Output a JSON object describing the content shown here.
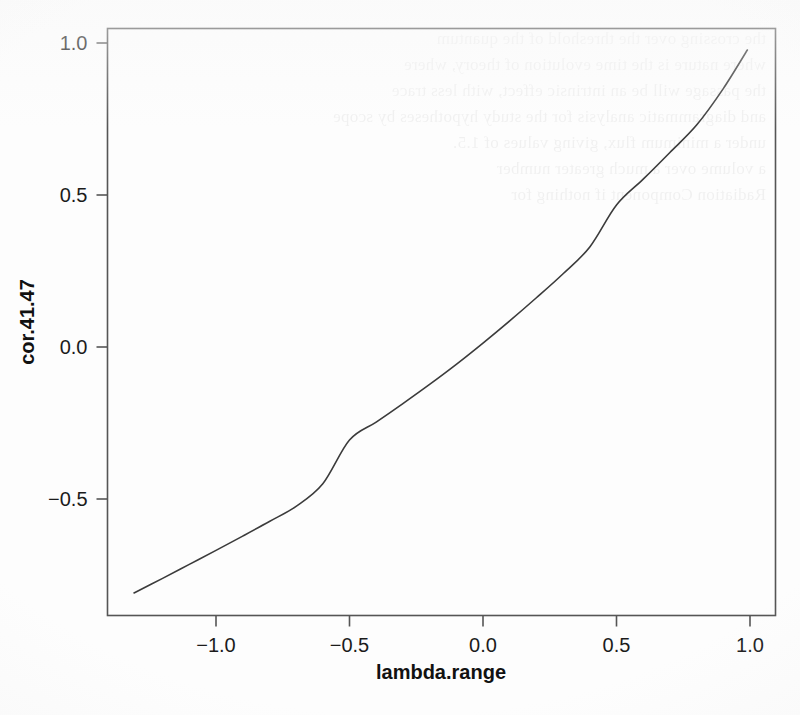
{
  "figure": {
    "background_color": "#fdfdfd",
    "ink_color": "#3b3b3b",
    "box_color": "#555555",
    "scan_bleed_lines": [
      "the crossing over the threshold of the quantum",
      "where nature is the time evolution of theory, where",
      "the passage will be an intrinsic effect, with less trace",
      "and diagrammatic analysis for the study hypotheses by scope",
      "under a minimum flux, giving values of 1.5.",
      "a volume over a much greater number",
      "Radiation Component if nothing for"
    ]
  },
  "chart_data": {
    "type": "line",
    "title": "",
    "xlabel": "lambda.range",
    "ylabel": "cor.41.47",
    "xlim": [
      -1.37,
      1.06
    ],
    "ylim": [
      -0.88,
      1.06
    ],
    "xticks": [
      -1.0,
      -0.5,
      0.0,
      0.5,
      1.0
    ],
    "xtick_labels": [
      "−1.0",
      "−0.5",
      "0.0",
      "0.5",
      "1.0"
    ],
    "yticks": [
      -0.5,
      0.0,
      0.5,
      1.0
    ],
    "ytick_labels": [
      "−0.5",
      "0.0",
      "0.5",
      "1.0"
    ],
    "grid": false,
    "legend": "none",
    "series": [
      {
        "name": "cor.41.47",
        "color": "#3b3b3b",
        "line_width": 1.6,
        "x": [
          -1.307,
          -1.2,
          -1.1,
          -1.0,
          -0.9,
          -0.8,
          -0.7,
          -0.6,
          -0.5,
          -0.4,
          -0.3,
          -0.2,
          -0.1,
          0.0,
          0.1,
          0.2,
          0.3,
          0.4,
          0.5,
          0.6,
          0.7,
          0.8,
          0.9,
          0.99
        ],
        "y": [
          -0.809,
          -0.761,
          -0.715,
          -0.669,
          -0.622,
          -0.574,
          -0.524,
          -0.45,
          -0.306,
          -0.247,
          -0.186,
          -0.123,
          -0.057,
          0.013,
          0.086,
          0.162,
          0.241,
          0.329,
          0.467,
          0.552,
          0.64,
          0.73,
          0.85,
          0.977
        ]
      }
    ]
  }
}
